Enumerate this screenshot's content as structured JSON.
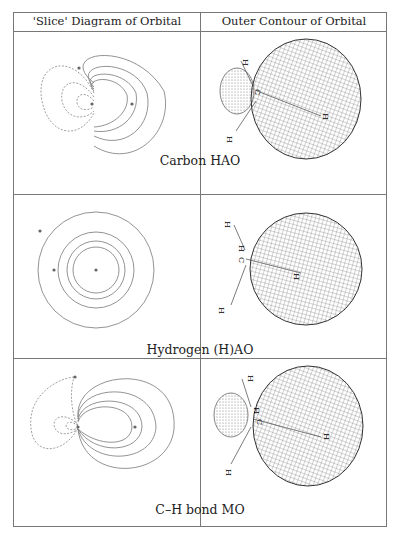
{
  "table": {
    "headers": [
      "'Slice' Diagram of Orbital",
      "Outer Contour of Orbital"
    ],
    "rows": [
      {
        "caption": "Carbon HAO",
        "slice_desc": "contour slice with dashed negative lobe left, solid positive lobe right",
        "contour_desc": "small dotted back lobe, large meshed front lobe"
      },
      {
        "caption": "Hydrogen (H)AO",
        "slice_desc": "concentric solid circles around hydrogen nucleus",
        "contour_desc": "spherical meshed surface"
      },
      {
        "caption": "C–H bond MO",
        "slice_desc": "contour slice with dashed negative region, solid bonding region",
        "contour_desc": "small dotted lobe, large meshed lobe"
      }
    ]
  },
  "atom_labels": {
    "carbon": "C",
    "hydrogen": "H"
  }
}
